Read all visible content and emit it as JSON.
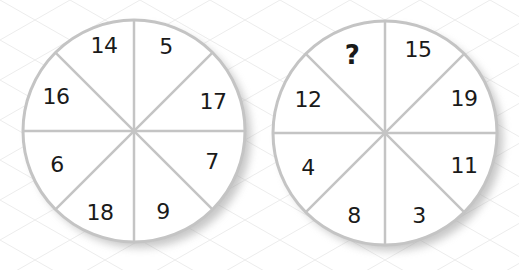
{
  "puzzle": {
    "wheels": [
      {
        "id": "left",
        "center": [
          134,
          131
        ],
        "radius": 111,
        "segments": [
          {
            "value": "14",
            "pos": [
              104,
              46
            ]
          },
          {
            "value": "5",
            "pos": [
              166,
              47
            ]
          },
          {
            "value": "17",
            "pos": [
              213,
              102
            ]
          },
          {
            "value": "7",
            "pos": [
              212,
              162
            ]
          },
          {
            "value": "9",
            "pos": [
              163,
              212
            ]
          },
          {
            "value": "18",
            "pos": [
              100,
              213
            ]
          },
          {
            "value": "6",
            "pos": [
              57,
              165
            ]
          },
          {
            "value": "16",
            "pos": [
              56,
              97
            ]
          }
        ]
      },
      {
        "id": "right",
        "center": [
          385,
          133
        ],
        "radius": 112,
        "segments": [
          {
            "value": "?",
            "pos": [
              352,
              55
            ],
            "unknown": true
          },
          {
            "value": "15",
            "pos": [
              418,
              50
            ]
          },
          {
            "value": "19",
            "pos": [
              464,
              99
            ]
          },
          {
            "value": "11",
            "pos": [
              464,
              166
            ]
          },
          {
            "value": "3",
            "pos": [
              419,
              216
            ]
          },
          {
            "value": "8",
            "pos": [
              354,
              216
            ]
          },
          {
            "value": "4",
            "pos": [
              308,
              168
            ]
          },
          {
            "value": "12",
            "pos": [
              308,
              100
            ]
          }
        ]
      }
    ]
  },
  "colors": {
    "background": "#ffffff",
    "grid": "#e9e9e9",
    "wheel_stroke": "#c4c4c4",
    "wheel_fill": "#ffffff",
    "text": "#1a1a1a",
    "shadow": "#9a9a9a"
  }
}
